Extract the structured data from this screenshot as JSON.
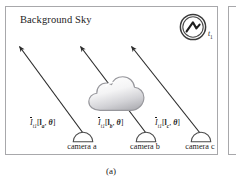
{
  "figure": {
    "caption": "(a)",
    "panel_label": "(a)"
  },
  "scene": {
    "title": "Background Sky",
    "background_color": "#ffffff",
    "frame_color": "#a8a8ab"
  },
  "sun": {
    "icon": "sun-icon",
    "label": "t",
    "label_subscript": "1",
    "color": "#3a3a3a"
  },
  "cloud": {
    "icon": "cloud-icon",
    "fill_light": "#fdfdfd",
    "fill_dark": "#b9b9bc",
    "outline": "#9a9a9e"
  },
  "rays": {
    "color": "#2b2b2b",
    "count": 3,
    "items": [
      {
        "name": "ray-camera-a",
        "from_camera": "camera a"
      },
      {
        "name": "ray-camera-b",
        "from_camera": "camera b"
      },
      {
        "name": "ray-camera-c",
        "from_camera": "camera c"
      }
    ]
  },
  "radiance_labels": [
    {
      "symbol": "I",
      "overbar": true,
      "time_subscript": "t",
      "time_index": "1",
      "open_bracket": "[",
      "direction": "l",
      "direction_subscript": "a",
      "separator": ",",
      "angle": "θ",
      "close_bracket": "]",
      "plain": "Ī t1 [ la , θ ]"
    },
    {
      "symbol": "I",
      "overbar": true,
      "time_subscript": "t",
      "time_index": "1",
      "open_bracket": "[",
      "direction": "l",
      "direction_subscript": "b",
      "separator": ",",
      "angle": "θ",
      "close_bracket": "]",
      "plain": "Ī t1 [ lb , θ ]"
    },
    {
      "symbol": "I",
      "overbar": true,
      "time_subscript": "t",
      "time_index": "1",
      "open_bracket": "[",
      "direction": "l",
      "direction_subscript": "c",
      "separator": ",",
      "angle": "θ",
      "close_bracket": "]",
      "plain": "Ī t1 [ lc , θ ]"
    }
  ],
  "cameras": [
    {
      "icon": "camera-dome-icon",
      "label": "camera a"
    },
    {
      "icon": "camera-dome-icon",
      "label": "camera b"
    },
    {
      "icon": "camera-dome-icon",
      "label": "camera c"
    }
  ]
}
